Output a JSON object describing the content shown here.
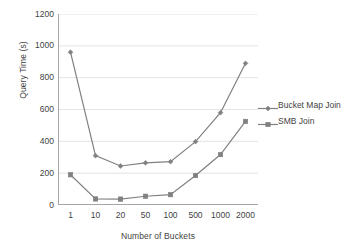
{
  "chart_data": {
    "type": "line",
    "title": "",
    "xlabel": "Number of Buckets",
    "ylabel": "Query Time (s)",
    "categories": [
      "1",
      "10",
      "20",
      "50",
      "100",
      "500",
      "1000",
      "2000"
    ],
    "ylim": [
      0,
      1200
    ],
    "yticks": [
      "0",
      "200",
      "400",
      "600",
      "800",
      "1000",
      "1200"
    ],
    "grid": "horizontal",
    "legend_position": "right",
    "series": [
      {
        "name": "Bucket Map Join",
        "marker": "diamond",
        "color": "#808080",
        "values": [
          960,
          310,
          245,
          265,
          272,
          398,
          580,
          890
        ]
      },
      {
        "name": "SMB Join",
        "marker": "square",
        "color": "#808080",
        "values": [
          190,
          38,
          37,
          55,
          65,
          185,
          317,
          525
        ]
      }
    ]
  },
  "axes": {
    "y_title": "Query Time (s)",
    "x_title": "Number of Buckets"
  },
  "colors": {
    "series_line": "#808080",
    "grid": "#d9d9d9",
    "axis": "#a6a6a6",
    "text": "#3f3f3f",
    "background": "#ffffff"
  }
}
